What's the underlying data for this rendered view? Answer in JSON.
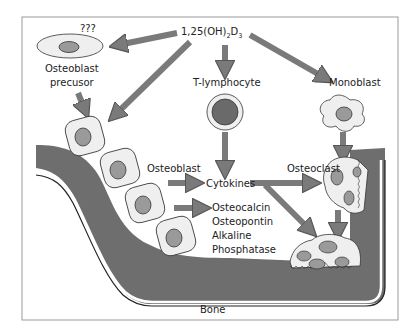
{
  "diagram": {
    "title_prefix": "1,25(OH)",
    "title_sub1": "2",
    "title_mid": "D",
    "title_sub2": "3",
    "labels": {
      "unknown": "???",
      "osteoblast_precursor_1": "Osteoblast",
      "osteoblast_precursor_2": "precusor",
      "t_lymphocyte": "T-lymphocyte",
      "monoblast": "Monoblast",
      "osteoblast": "Osteoblast",
      "cytokines": "Cytokines",
      "osteoclast": "Osteoclast",
      "products": [
        "Osteocalcin",
        "Osteopontin",
        "Alkaline",
        "Phosphatase"
      ],
      "bone": "Bone"
    },
    "colors": {
      "arrow": "#7a7a7a",
      "bone": "#6e6e6e",
      "cell_fill": "#efefef",
      "nucleus": "#9a9a9a",
      "lymph_nucleus": "#6a6a6a",
      "frame": "#999999"
    }
  }
}
